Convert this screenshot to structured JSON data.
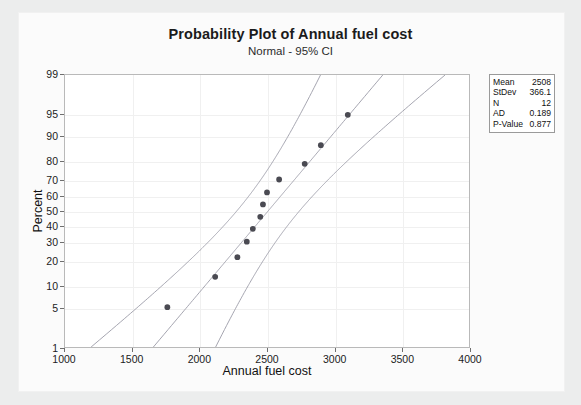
{
  "figure": {
    "title": "Probability Plot of Annual fuel cost",
    "subtitle": "Normal - 95% CI"
  },
  "stats": {
    "rows": [
      {
        "key": "Mean",
        "value": "2508"
      },
      {
        "key": "StDev",
        "value": "366.1"
      },
      {
        "key": "N",
        "value": "12"
      },
      {
        "key": "AD",
        "value": "0.189"
      },
      {
        "key": "P-Value",
        "value": "0.877"
      }
    ]
  },
  "chart_data": {
    "type": "scatter",
    "title": "Probability Plot of Annual fuel cost",
    "subtitle": "Normal - 95% CI",
    "xlabel": "Annual fuel cost",
    "ylabel": "Percent",
    "xlim": [
      1000,
      4000
    ],
    "ylim": [
      1,
      99
    ],
    "yscale": "normal-probability",
    "grid": true,
    "legend": "none",
    "xticks": [
      1000,
      1500,
      2000,
      2500,
      3000,
      3500,
      4000
    ],
    "yticks": [
      1,
      5,
      10,
      20,
      30,
      40,
      50,
      60,
      70,
      80,
      90,
      95,
      99
    ],
    "distribution": "Normal",
    "confidence_level": "95% CI",
    "fit_mean": 2508,
    "fit_stdev": 366.1,
    "n": 12,
    "ad_statistic": 0.189,
    "p_value": 0.877,
    "points": [
      {
        "x": 1760,
        "percent": 5.0
      },
      {
        "x": 2115,
        "percent": 13.0
      },
      {
        "x": 2280,
        "percent": 21.5
      },
      {
        "x": 2350,
        "percent": 30.0
      },
      {
        "x": 2395,
        "percent": 38.0
      },
      {
        "x": 2450,
        "percent": 46.0
      },
      {
        "x": 2470,
        "percent": 54.5
      },
      {
        "x": 2500,
        "percent": 62.5
      },
      {
        "x": 2590,
        "percent": 70.5
      },
      {
        "x": 2780,
        "percent": 79.0
      },
      {
        "x": 2900,
        "percent": 87.0
      },
      {
        "x": 3100,
        "percent": 95.0
      }
    ],
    "series": [
      {
        "name": "Fitted normal line",
        "style": "line"
      },
      {
        "name": "Lower 95% CI bound",
        "style": "line"
      },
      {
        "name": "Upper 95% CI bound",
        "style": "line"
      }
    ]
  },
  "colors": {
    "point": "#4a4a52",
    "line": "#9a9aa6",
    "frame": "#b9b9b9",
    "grid": "#f0f0f0",
    "background": "#eceded",
    "card": "#fbfbfb"
  }
}
